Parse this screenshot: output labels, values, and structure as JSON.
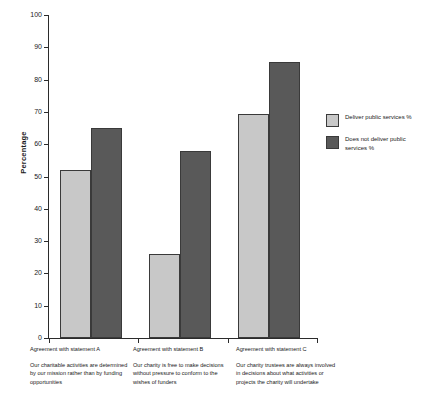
{
  "chart_data": {
    "type": "bar",
    "title": "",
    "xlabel": "",
    "ylabel": "Percentage",
    "ylim": [
      0,
      100
    ],
    "ytick_step": 10,
    "yticks": [
      0,
      10,
      20,
      30,
      40,
      50,
      60,
      70,
      80,
      90,
      100
    ],
    "grid": false,
    "legend_position": "right",
    "categories": [
      "Agreement with statement A",
      "Agreement with statement B",
      "Agreement with statement C"
    ],
    "category_descriptions": [
      "Our charitable activities are determined by our mission rather than by funding opportunities",
      "Our charity is free to make decisions without pressure to conform to the wishes of funders",
      "Our charity trustees are always involved in decisions about what activities or projects the charity will undertake"
    ],
    "series": [
      {
        "name": "Deliver public services %",
        "color": "#c8c8c8",
        "values": [
          52,
          26,
          69.5
        ]
      },
      {
        "name": "Does not deliver public services %",
        "color": "#595959",
        "values": [
          65,
          58,
          85.5
        ]
      }
    ]
  },
  "legend": {
    "items": [
      {
        "label": "Deliver public services %",
        "color": "#c8c8c8"
      },
      {
        "label": "Does not deliver public services %",
        "color": "#595959"
      }
    ]
  },
  "axis": {
    "y_title": "Percentage",
    "y_labels": [
      "100",
      "90",
      "80",
      "70",
      "60",
      "50",
      "40",
      "30",
      "20",
      "10",
      "0"
    ]
  },
  "captions": [
    {
      "heading": "Agreement with statement A",
      "body": "Our charitable activities are determined by our mission rather than by funding opportunities"
    },
    {
      "heading": "Agreement with statement B",
      "body": "Our charity is free to make decisions without pressure to conform to the wishes of funders"
    },
    {
      "heading": "Agreement with statement C",
      "body": "Our charity trustees are always involved in decisions about what activities or projects the charity will undertake"
    }
  ]
}
